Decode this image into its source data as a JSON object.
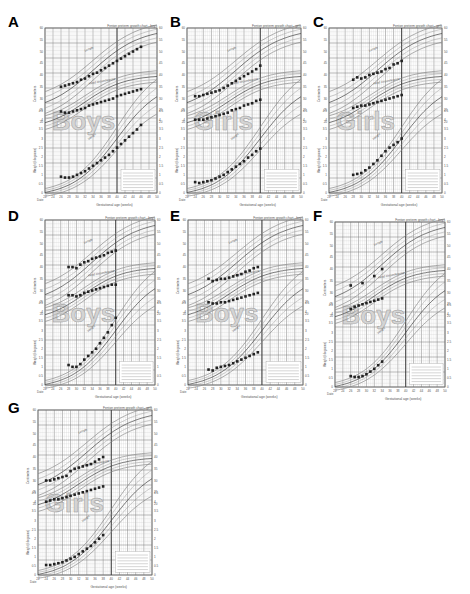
{
  "figure": {
    "panels": [
      {
        "id": "A",
        "sex": "Boys",
        "title": "Fenton preterm growth chart - boys",
        "box": {
          "x": 45,
          "y": 28,
          "w": 112,
          "h": 165
        },
        "label_pos": {
          "x": 8,
          "y": 14
        }
      },
      {
        "id": "B",
        "sex": "Girls",
        "title": "Fenton preterm growth chart - girls",
        "box": {
          "x": 187,
          "y": 28,
          "w": 114,
          "h": 165
        },
        "label_pos": {
          "x": 170,
          "y": 14
        }
      },
      {
        "id": "C",
        "sex": "Girls",
        "title": "Fenton preterm growth chart - girls",
        "box": {
          "x": 329,
          "y": 28,
          "w": 113,
          "h": 165
        },
        "label_pos": {
          "x": 313,
          "y": 14
        }
      },
      {
        "id": "D",
        "sex": "Boys",
        "title": "Fenton preterm growth chart - boys",
        "box": {
          "x": 45,
          "y": 220,
          "w": 110,
          "h": 165
        },
        "label_pos": {
          "x": 8,
          "y": 208
        }
      },
      {
        "id": "E",
        "sex": "Boys",
        "title": "Fenton preterm growth chart - boys",
        "box": {
          "x": 188,
          "y": 220,
          "w": 115,
          "h": 165
        },
        "label_pos": {
          "x": 170,
          "y": 208
        }
      },
      {
        "id": "F",
        "sex": "Boys",
        "title": "Fenton preterm growth chart - boys",
        "box": {
          "x": 335,
          "y": 222,
          "w": 110,
          "h": 165
        },
        "label_pos": {
          "x": 313,
          "y": 208
        }
      },
      {
        "id": "G",
        "sex": "Girls",
        "title": "Fenton preterm growth chart - girls",
        "box": {
          "x": 38,
          "y": 410,
          "w": 114,
          "h": 165
        },
        "label_pos": {
          "x": 8,
          "y": 400
        }
      }
    ]
  },
  "chart_data": [
    {
      "panel": "A",
      "type": "line",
      "title": "Fenton preterm growth chart - boys",
      "watermark": "Boys",
      "xlabel": "Gestational age (weeks)",
      "ylabel_upper": "Centimeters",
      "ylabel_lower": "Weight (kilograms)",
      "xlim": [
        22,
        50
      ],
      "ylim_cm": [
        20,
        60
      ],
      "ylim_kg": [
        0,
        5
      ],
      "series": [
        {
          "name": "Length (cm)",
          "x": [
            26,
            27,
            28,
            29,
            30,
            31,
            32,
            33,
            34,
            35,
            36,
            37,
            38,
            39,
            40,
            41,
            42,
            43,
            44,
            45,
            46
          ],
          "values": [
            35,
            35.5,
            36,
            36.5,
            37,
            38,
            38.5,
            39.5,
            40.5,
            41,
            42,
            43,
            44,
            45,
            46,
            47,
            48,
            49,
            50,
            51,
            52
          ]
        },
        {
          "name": "Head circumference (cm)",
          "x": [
            26,
            27,
            28,
            29,
            30,
            31,
            32,
            33,
            34,
            35,
            36,
            37,
            38,
            39,
            40,
            41,
            42,
            43,
            44,
            45,
            46
          ],
          "values": [
            24.5,
            24,
            24,
            24.5,
            25,
            25.5,
            26,
            27,
            27.5,
            28,
            28.5,
            29,
            29.5,
            30,
            31,
            31.5,
            32,
            32.5,
            33,
            33.5,
            34
          ]
        },
        {
          "name": "Weight (kg)",
          "x": [
            26,
            27,
            28,
            29,
            30,
            31,
            32,
            33,
            34,
            35,
            36,
            37,
            38,
            39,
            40,
            41,
            42,
            43,
            44,
            45,
            46
          ],
          "values": [
            0.9,
            0.85,
            0.85,
            0.9,
            1.0,
            1.1,
            1.2,
            1.35,
            1.5,
            1.65,
            1.8,
            1.95,
            2.1,
            2.3,
            2.5,
            2.7,
            2.9,
            3.1,
            3.3,
            3.5,
            3.75
          ]
        }
      ]
    },
    {
      "panel": "B",
      "type": "line",
      "title": "Fenton preterm growth chart - girls",
      "watermark": "Girls",
      "xlabel": "Gestational age (weeks)",
      "ylabel_upper": "Centimeters",
      "ylabel_lower": "Weight (kilograms)",
      "xlim": [
        22,
        50
      ],
      "ylim_cm": [
        20,
        60
      ],
      "ylim_kg": [
        0,
        5
      ],
      "series": [
        {
          "name": "Length (cm)",
          "x": [
            24,
            25,
            26,
            27,
            28,
            29,
            30,
            31,
            32,
            33,
            34,
            35,
            36,
            37,
            38,
            39,
            40
          ],
          "values": [
            31,
            31,
            31.5,
            32,
            32.5,
            33,
            33.5,
            34.5,
            35.5,
            36.5,
            37.5,
            38.5,
            39.5,
            40.5,
            41.5,
            42.5,
            44
          ]
        },
        {
          "name": "Head circumference (cm)",
          "x": [
            24,
            25,
            26,
            27,
            28,
            29,
            30,
            31,
            32,
            33,
            34,
            35,
            36,
            37,
            38,
            39,
            40
          ],
          "values": [
            21,
            21,
            21,
            21.5,
            22,
            22.5,
            23,
            23.5,
            24,
            25,
            25.5,
            26,
            27,
            27.5,
            28,
            29,
            29.5
          ]
        },
        {
          "name": "Weight (kg)",
          "x": [
            24,
            25,
            26,
            27,
            28,
            29,
            30,
            31,
            32,
            33,
            34,
            35,
            36,
            37,
            38,
            39,
            40
          ],
          "values": [
            0.6,
            0.55,
            0.6,
            0.65,
            0.7,
            0.8,
            0.9,
            1.0,
            1.15,
            1.3,
            1.45,
            1.6,
            1.75,
            1.95,
            2.1,
            2.3,
            2.45
          ]
        }
      ]
    },
    {
      "panel": "C",
      "type": "line",
      "title": "Fenton preterm growth chart - girls",
      "watermark": "Girls",
      "xlabel": "Gestational age (weeks)",
      "ylabel_upper": "Centimeters",
      "ylabel_lower": "Weight (kilograms)",
      "xlim": [
        22,
        50
      ],
      "ylim_cm": [
        20,
        60
      ],
      "ylim_kg": [
        0,
        5
      ],
      "series": [
        {
          "name": "Length (cm)",
          "x": [
            28,
            29,
            30,
            31,
            32,
            33,
            34,
            35,
            36,
            37,
            38,
            39,
            40
          ],
          "values": [
            38,
            39,
            38.5,
            39,
            40,
            40.5,
            41,
            41.5,
            42.5,
            43,
            44.5,
            45,
            46
          ]
        },
        {
          "name": "Head circumference (cm)",
          "x": [
            28,
            29,
            30,
            31,
            32,
            33,
            34,
            35,
            36,
            37,
            38,
            39,
            40
          ],
          "values": [
            26,
            26.5,
            27,
            27,
            27.5,
            28,
            28.5,
            29,
            29.5,
            30,
            30.5,
            31,
            31.5
          ]
        },
        {
          "name": "Weight (kg)",
          "x": [
            28,
            29,
            30,
            31,
            32,
            33,
            34,
            35,
            36,
            37,
            38,
            39,
            40
          ],
          "values": [
            1.0,
            1.05,
            1.1,
            1.25,
            1.4,
            1.6,
            1.8,
            2.05,
            2.3,
            2.5,
            2.65,
            2.8,
            3.0
          ]
        }
      ]
    },
    {
      "panel": "D",
      "type": "line",
      "title": "Fenton preterm growth chart - boys",
      "watermark": "Boys",
      "xlabel": "Gestational age (weeks)",
      "ylabel_upper": "Centimeters",
      "ylabel_lower": "Weight (kilograms)",
      "xlim": [
        22,
        50
      ],
      "ylim_cm": [
        20,
        60
      ],
      "ylim_kg": [
        0,
        5
      ],
      "series": [
        {
          "name": "Length (cm)",
          "x": [
            28,
            29,
            30,
            31,
            32,
            33,
            34,
            35,
            36,
            37,
            38,
            39,
            40
          ],
          "values": [
            40,
            40,
            39.5,
            41,
            42,
            42.5,
            43.5,
            44,
            44.5,
            45,
            46,
            46.5,
            47
          ]
        },
        {
          "name": "Head circumference (cm)",
          "x": [
            28,
            29,
            30,
            31,
            32,
            33,
            34,
            35,
            36,
            37,
            38,
            39,
            40
          ],
          "values": [
            28,
            28,
            27.5,
            28,
            29,
            29.5,
            30,
            30.5,
            31,
            31.5,
            32,
            32.5,
            32.5
          ]
        },
        {
          "name": "Weight (kg)",
          "x": [
            28,
            29,
            30,
            31,
            32,
            33,
            34,
            35,
            36,
            37,
            38,
            39,
            40
          ],
          "values": [
            1.1,
            1.0,
            1.0,
            1.15,
            1.4,
            1.6,
            1.8,
            2.0,
            2.3,
            2.6,
            2.9,
            3.3,
            3.7
          ]
        }
      ]
    },
    {
      "panel": "E",
      "type": "line",
      "title": "Fenton preterm growth chart - boys",
      "watermark": "Boys",
      "xlabel": "Gestational age (weeks)",
      "ylabel_upper": "Centimeters",
      "ylabel_lower": "Weight (kilograms)",
      "xlim": [
        22,
        50
      ],
      "ylim_cm": [
        20,
        60
      ],
      "ylim_kg": [
        0,
        5
      ],
      "series": [
        {
          "name": "Length (cm)",
          "x": [
            27,
            28,
            29,
            30,
            31,
            32,
            33,
            34,
            35,
            36,
            37,
            38,
            39
          ],
          "values": [
            35,
            34,
            34.5,
            35,
            35,
            35.5,
            36,
            36.5,
            37,
            38,
            38.5,
            39.5,
            40
          ]
        },
        {
          "name": "Head circumference (cm)",
          "x": [
            27,
            28,
            29,
            30,
            31,
            32,
            33,
            34,
            35,
            36,
            37,
            38,
            39
          ],
          "values": [
            25,
            24.5,
            24.5,
            25,
            25,
            25.5,
            26,
            26.5,
            27,
            27.5,
            28,
            28.5,
            29
          ]
        },
        {
          "name": "Weight (kg)",
          "x": [
            27,
            28,
            29,
            30,
            31,
            32,
            33,
            34,
            35,
            36,
            37,
            38,
            39
          ],
          "values": [
            0.85,
            0.8,
            0.95,
            1.0,
            1.05,
            1.1,
            1.2,
            1.3,
            1.4,
            1.5,
            1.6,
            1.7,
            1.8
          ]
        }
      ]
    },
    {
      "panel": "F",
      "type": "line",
      "title": "Fenton preterm growth chart - boys",
      "watermark": "Boys",
      "xlabel": "Gestational age (weeks)",
      "ylabel_upper": "Centimeters",
      "ylabel_lower": "Weight (kilograms)",
      "xlim": [
        22,
        50
      ],
      "ylim_cm": [
        20,
        60
      ],
      "ylim_kg": [
        0,
        5
      ],
      "series": [
        {
          "name": "Length (cm)",
          "x": [
            26,
            29,
            32,
            34
          ],
          "values": [
            33,
            34,
            37,
            40
          ]
        },
        {
          "name": "Head circumference (cm)",
          "x": [
            26,
            27,
            28,
            29,
            30,
            31,
            32,
            33,
            34
          ],
          "values": [
            23,
            24,
            24.5,
            25,
            25.5,
            26,
            26.5,
            27,
            27.5
          ]
        },
        {
          "name": "Weight (kg)",
          "x": [
            26,
            27,
            28,
            29,
            30,
            31,
            32,
            33,
            34
          ],
          "values": [
            0.6,
            0.55,
            0.55,
            0.6,
            0.7,
            0.85,
            1.0,
            1.2,
            1.4
          ]
        }
      ]
    },
    {
      "panel": "G",
      "type": "line",
      "title": "Fenton preterm growth chart - girls",
      "watermark": "Girls",
      "xlabel": "Gestational age (weeks)",
      "ylabel_upper": "Centimeters",
      "ylabel_lower": "Weight (kilograms)",
      "xlim": [
        22,
        50
      ],
      "ylim_cm": [
        20,
        60
      ],
      "ylim_kg": [
        0,
        5
      ],
      "series": [
        {
          "name": "Length (cm)",
          "x": [
            24,
            25,
            26,
            27,
            28,
            29,
            30,
            31,
            32,
            33,
            34,
            35,
            36,
            37,
            38
          ],
          "values": [
            30,
            30,
            30.5,
            31,
            31.5,
            32,
            34,
            35,
            35.5,
            36,
            36.5,
            37,
            38,
            39,
            40
          ]
        },
        {
          "name": "Head circumference (cm)",
          "x": [
            24,
            25,
            26,
            27,
            28,
            29,
            30,
            31,
            32,
            33,
            34,
            35,
            36,
            37,
            38
          ],
          "values": [
            21,
            21.5,
            22,
            22,
            22.5,
            23,
            23.5,
            24,
            24.5,
            25,
            25.5,
            26,
            26.5,
            27,
            27.5
          ]
        },
        {
          "name": "Weight (kg)",
          "x": [
            24,
            25,
            26,
            27,
            28,
            29,
            30,
            31,
            32,
            33,
            34,
            35,
            36,
            37,
            38
          ],
          "values": [
            0.55,
            0.55,
            0.6,
            0.65,
            0.7,
            0.8,
            0.9,
            1.0,
            1.15,
            1.3,
            1.45,
            1.6,
            1.8,
            2.0,
            2.2
          ]
        }
      ]
    }
  ],
  "axis_text": {
    "x_ticks": [
      22,
      24,
      26,
      28,
      30,
      32,
      34,
      36,
      38,
      40,
      42,
      44,
      46,
      48,
      50
    ],
    "cm_ticks": [
      20,
      25,
      30,
      35,
      40,
      45,
      50,
      55,
      60
    ],
    "kg_ticks": [
      0,
      0.5,
      1,
      1.5,
      2,
      2.5,
      3,
      3.5,
      4,
      4.5
    ],
    "curve_labels": [
      "Length",
      "Head circumference",
      "Weight"
    ],
    "x_unit_label": "Date"
  },
  "colors": {
    "grid": "#bdbdbd",
    "grid_major": "#7a7a7a",
    "percentile": "#8a8a8a",
    "median": "#444444",
    "points": "#222222",
    "watermark_fill": "#d4d4d4"
  }
}
